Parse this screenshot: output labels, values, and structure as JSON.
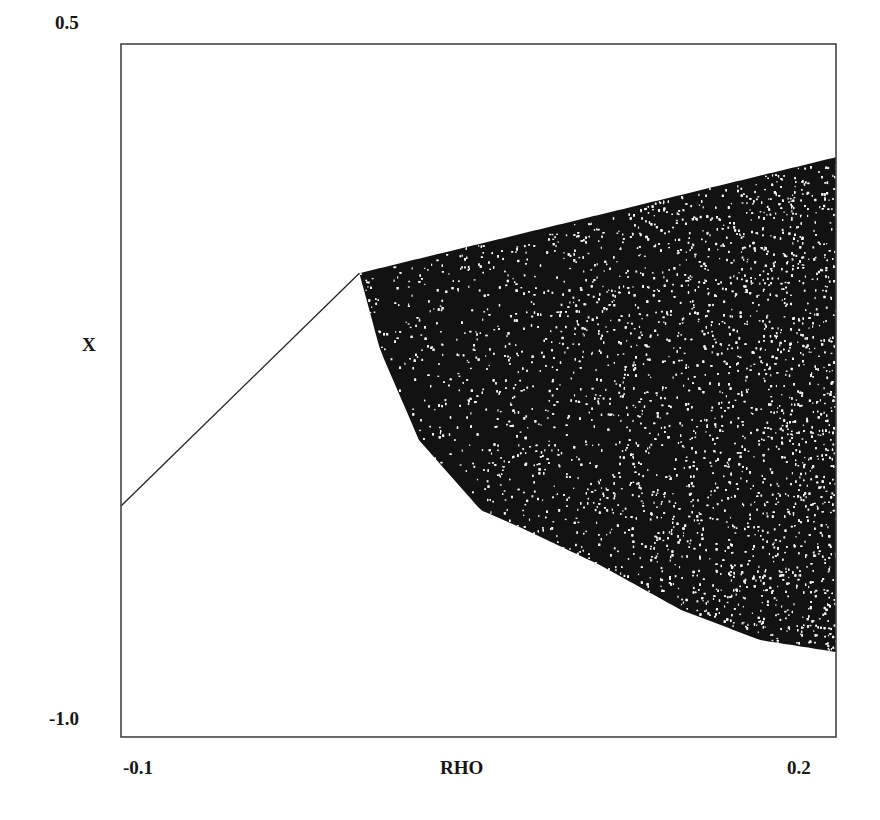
{
  "chart_data": {
    "type": "scatter",
    "title": "",
    "xlabel": "RHO",
    "ylabel": "X",
    "xlim": [
      -0.1,
      0.2
    ],
    "ylim": [
      -1.0,
      0.5
    ],
    "x_tick_labels": [
      "-0.1",
      "0.2"
    ],
    "y_tick_labels": [
      "0.5",
      "-1.0"
    ],
    "grid": false,
    "legend": null,
    "series": [
      {
        "name": "stable-branch",
        "kind": "line",
        "points": [
          [
            -0.1,
            -0.5
          ],
          [
            0.0,
            0.004
          ]
        ]
      },
      {
        "name": "chaotic-band",
        "kind": "scatter-region",
        "upper_envelope": [
          [
            0.0,
            0.004
          ],
          [
            0.05,
            0.045
          ],
          [
            0.1,
            0.087
          ],
          [
            0.15,
            0.13
          ],
          [
            0.2,
            0.255
          ]
        ],
        "lower_envelope": [
          [
            0.0,
            0.004
          ],
          [
            0.0087,
            -0.162
          ],
          [
            0.025,
            -0.357
          ],
          [
            0.051,
            -0.509
          ],
          [
            0.067,
            -0.545
          ],
          [
            0.101,
            -0.628
          ],
          [
            0.135,
            -0.725
          ],
          [
            0.168,
            -0.79
          ],
          [
            0.2,
            -0.816
          ]
        ]
      }
    ]
  },
  "colors": {
    "ink": "#111111",
    "background": "#ffffff",
    "axis": "#444444"
  }
}
